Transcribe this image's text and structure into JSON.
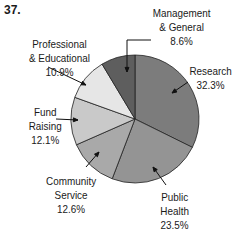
{
  "problem_number": "37.",
  "chart_data": {
    "type": "pie",
    "title": "",
    "start_angle_deg": 0,
    "direction": "clockwise",
    "slices": [
      {
        "label": "Research",
        "value": 32.3,
        "display": "32.3%",
        "color": "#7c7c7c"
      },
      {
        "label": "Public Health",
        "value": 23.5,
        "display": "23.5%",
        "color": "#949494"
      },
      {
        "label": "Community Service",
        "value": 12.6,
        "display": "12.6%",
        "color": "#a9a9a9"
      },
      {
        "label": "Fund Raising",
        "value": 12.1,
        "display": "12.1%",
        "color": "#c9c9c9"
      },
      {
        "label": "Professional & Educational",
        "value": 10.9,
        "display": "10.9%",
        "color": "#e6e6e6"
      },
      {
        "label": "Management & General",
        "value": 8.6,
        "display": "8.6%",
        "color": "#5e5e5e"
      }
    ]
  },
  "labels": {
    "management": "Management\n& General\n8.6%",
    "research": "Research\n32.3%",
    "professional": "Professional\n& Educational\n10.9%",
    "fund": "Fund\nRaising\n12.1%",
    "community": "Community\nService\n12.6%",
    "public": "Public\nHealth\n23.5%"
  }
}
